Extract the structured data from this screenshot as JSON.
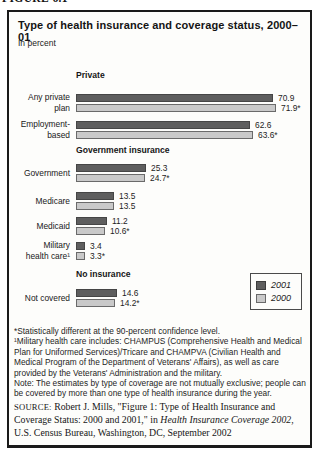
{
  "figure_label": "FIGURE 6.1",
  "header": {
    "title": "Type of health insurance and coverage status, 2000–01",
    "unit": "In percent"
  },
  "colors": {
    "bar_2001": "#5e5e5e",
    "bar_2000": "#c9c9c9",
    "bar_2000_border": "#6a6a6a",
    "box_border": "#1a1a1a"
  },
  "chart_data": {
    "type": "bar",
    "orientation": "horizontal",
    "title": "Type of health insurance and coverage status, 2000–01",
    "unit": "In percent",
    "xlim": [
      0,
      80
    ],
    "grid": false,
    "legend_position": "bottom-right",
    "categories": [
      "Any private plan",
      "Employment-based",
      "Government",
      "Medicare",
      "Medicaid",
      "Military health care¹",
      "Not covered"
    ],
    "series": [
      {
        "name": "2001",
        "values": [
          70.9,
          62.6,
          25.3,
          13.5,
          11.2,
          3.4,
          14.6
        ]
      },
      {
        "name": "2000",
        "values": [
          71.9,
          63.6,
          24.7,
          13.5,
          10.6,
          3.3,
          14.2
        ]
      }
    ],
    "sections": [
      {
        "id": "private",
        "heading": "Private",
        "rows": [
          "any-private-plan",
          "employment-based"
        ]
      },
      {
        "id": "government-insurance",
        "heading": "Government insurance",
        "rows": [
          "government",
          "medicare",
          "medicaid",
          "military-health-care"
        ]
      },
      {
        "id": "no-insurance",
        "heading": "No insurance",
        "rows": [
          "not-covered"
        ]
      }
    ],
    "rows": [
      {
        "id": "any-private-plan",
        "label_lines": [
          "Any private",
          "plan"
        ],
        "v2001": 70.9,
        "v2000": 71.9,
        "label2001": "70.9",
        "label2000": "71.9*"
      },
      {
        "id": "employment-based",
        "label_lines": [
          "Employment-",
          "based"
        ],
        "v2001": 62.6,
        "v2000": 63.6,
        "label2001": "62.6",
        "label2000": "63.6*"
      },
      {
        "id": "government",
        "label_lines": [
          "Government"
        ],
        "v2001": 25.3,
        "v2000": 24.7,
        "label2001": "25.3",
        "label2000": "24.7*"
      },
      {
        "id": "medicare",
        "label_lines": [
          "Medicare"
        ],
        "v2001": 13.5,
        "v2000": 13.5,
        "label2001": "13.5",
        "label2000": "13.5"
      },
      {
        "id": "medicaid",
        "label_lines": [
          "Medicaid"
        ],
        "v2001": 11.2,
        "v2000": 10.6,
        "label2001": "11.2",
        "label2000": "10.6*"
      },
      {
        "id": "military-health-care",
        "label_lines": [
          "Military",
          "health care¹"
        ],
        "v2001": 3.4,
        "v2000": 3.3,
        "label2001": "3.4",
        "label2000": "3.3*"
      },
      {
        "id": "not-covered",
        "label_lines": [
          "Not covered"
        ],
        "v2001": 14.6,
        "v2000": 14.2,
        "label2001": "14.6",
        "label2000": "14.2*"
      }
    ]
  },
  "legend": {
    "items": [
      {
        "label": "2001",
        "swatch": "dark"
      },
      {
        "label": "2000",
        "swatch": "light"
      }
    ]
  },
  "footnotes": {
    "star": "*Statistically different at the 90-percent confidence level.",
    "military": "¹Military health care includes: CHAMPUS (Comprehensive Health and Medical Plan for Uniformed Services)/Tricare and CHAMPVA (Civilian Health and Medical Program of the Department of Veterans' Affairs), as well as care provided by the Veterans' Administration and the military.",
    "note": "Note: The estimates by type of coverage are not mutually exclusive; people can be covered by more than one type of health insurance during the year."
  },
  "source": {
    "label": "SOURCE:",
    "pre": " Robert J. Mills, \"Figure 1: Type of Health Insurance and Coverage Status: 2000 and 2001,\" in ",
    "italic": "Health Insurance Coverage 2002",
    "post": ", U.S. Census Bureau, Washington, DC, September 2002"
  }
}
